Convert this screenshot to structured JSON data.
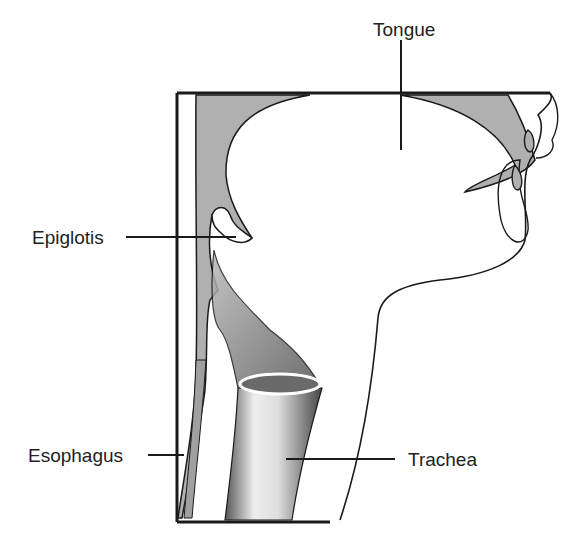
{
  "diagram": {
    "labels": {
      "tongue": "Tongue",
      "epiglottis": "Epiglotis",
      "esophagus": "Esophagus",
      "trachea": "Trachea"
    },
    "colors": {
      "line": "#1a1a1a",
      "shade": "#a8a8a8",
      "background": "#ffffff"
    }
  }
}
